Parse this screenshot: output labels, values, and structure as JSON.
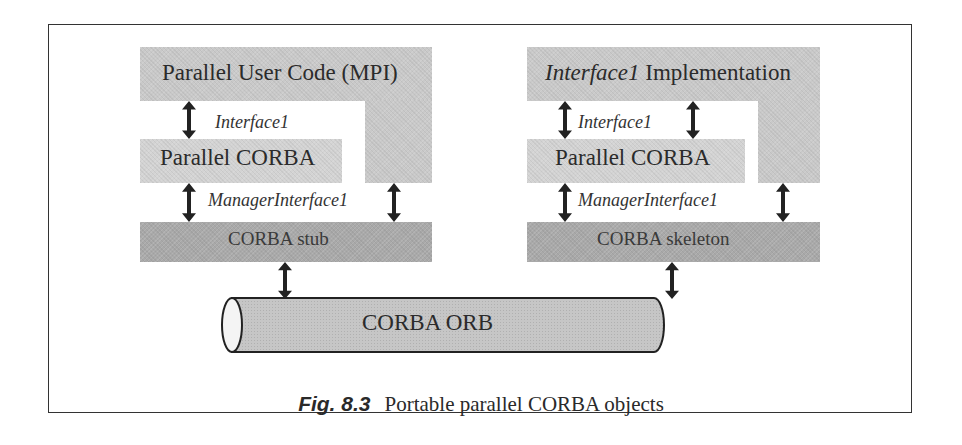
{
  "diagram": {
    "left": {
      "top_block": "Parallel User Code (MPI)",
      "interface_label": "Interface1",
      "middle_block": "Parallel CORBA",
      "manager_label": "ManagerInterface1",
      "bottom_block": "CORBA stub"
    },
    "right": {
      "top_block_italic": "Interface1",
      "top_block_rest": " Implementation",
      "interface_label": "Interface1",
      "middle_block": "Parallel CORBA",
      "manager_label": "ManagerInterface1",
      "bottom_block": "CORBA skeleton"
    },
    "orb": "CORBA ORB",
    "arrow_icon": "double-headed-vertical-arrow"
  },
  "caption": {
    "figure_number": "Fig. 8.3",
    "text": "Portable parallel CORBA objects"
  }
}
